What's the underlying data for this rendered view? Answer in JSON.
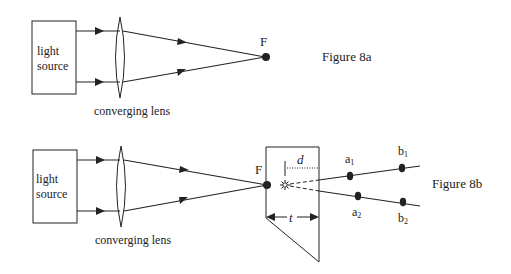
{
  "figure_a": {
    "caption": "Figure 8a",
    "source_label_line1": "light",
    "source_label_line2": "source",
    "lens_label": "converging lens",
    "focus_label": "F"
  },
  "figure_b": {
    "caption": "Figure 8b",
    "source_label_line1": "light",
    "source_label_line2": "source",
    "lens_label": "converging lens",
    "focus_label": "F",
    "depth_label": "d",
    "thickness_label": "t",
    "points": {
      "a1": {
        "base": "a",
        "sub": "1"
      },
      "b1": {
        "base": "b",
        "sub": "1"
      },
      "a2": {
        "base": "a",
        "sub": "2"
      },
      "b2": {
        "base": "b",
        "sub": "2"
      }
    }
  },
  "colors": {
    "line": "#222222",
    "background": "#ffffff"
  }
}
